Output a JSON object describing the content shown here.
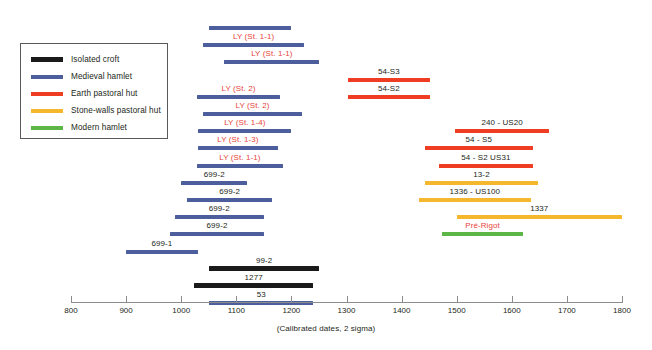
{
  "chart_data": {
    "type": "bar",
    "orientation": "horizontal-ranges",
    "title": "",
    "xlabel": "(Calibrated dates, 2 sigma)",
    "ylabel": "",
    "xlim": [
      800,
      1800
    ],
    "xticks": [
      800,
      900,
      1000,
      1100,
      1200,
      1300,
      1400,
      1500,
      1600,
      1700,
      1800
    ],
    "grid": false,
    "legend_position": "top-left",
    "categories": [
      "",
      "LY (St. 1-1)",
      "LY (St. 1-1)",
      "54-S3",
      "LY (St. 2)",
      "54-S2",
      "LY (St. 2)",
      "LY (St. 1-4)",
      "240 - US20",
      "LY (St. 1-3)",
      "54 - S5",
      "LY (St. 1-1)",
      "54 - S2 US31",
      "699-2",
      "13-2",
      "699-2",
      "1336 - US100",
      "699-2",
      "1337",
      "699-2",
      "Pré-Rigot",
      "699-1",
      "99-2",
      "1277",
      "53"
    ],
    "series": [
      {
        "name": "Isolated croft",
        "color": "#1a1a1a",
        "ranges": [
          {
            "label": "99-2",
            "start": 1051,
            "end": 1250
          },
          {
            "label": "1277",
            "start": 1023,
            "end": 1240
          }
        ]
      },
      {
        "name": "Medieval hamlet",
        "color": "#4d5e9c",
        "ranges": [
          {
            "label": "",
            "start": 1051,
            "end": 1200
          },
          {
            "label": "LY (St. 1-1)",
            "start": 1040,
            "end": 1223
          },
          {
            "label": "LY (St. 1-1)",
            "start": 1078,
            "end": 1251
          },
          {
            "label": "LY (St. 2)",
            "start": 1028,
            "end": 1180
          },
          {
            "label": "LY (St. 2)",
            "start": 1040,
            "end": 1219
          },
          {
            "label": "LY (St. 1-4)",
            "start": 1031,
            "end": 1200
          },
          {
            "label": "LY (St. 1-3)",
            "start": 1031,
            "end": 1175
          },
          {
            "label": "LY (St. 1-1)",
            "start": 1028,
            "end": 1185
          },
          {
            "label": "699-2",
            "start": 1000,
            "end": 1120
          },
          {
            "label": "699-2",
            "start": 1011,
            "end": 1165
          },
          {
            "label": "699-2",
            "start": 988,
            "end": 1150
          },
          {
            "label": "699-2",
            "start": 980,
            "end": 1150
          },
          {
            "label": "699-1",
            "start": 900,
            "end": 1030
          },
          {
            "label": "53",
            "start": 1051,
            "end": 1240
          }
        ]
      },
      {
        "name": "Earth pastoral hut",
        "color": "#ee3d23",
        "ranges": [
          {
            "label": "54-S3",
            "start": 1302,
            "end": 1452
          },
          {
            "label": "54-S2",
            "start": 1302,
            "end": 1452
          },
          {
            "label": "240 - US20",
            "start": 1497,
            "end": 1668
          },
          {
            "label": "54 - S5",
            "start": 1442,
            "end": 1638
          },
          {
            "label": "54 - S2 US31",
            "start": 1468,
            "end": 1638
          }
        ]
      },
      {
        "name": "Stone-walls pastoral hut",
        "color": "#f5b72e",
        "ranges": [
          {
            "label": "13-2",
            "start": 1442,
            "end": 1648
          },
          {
            "label": "1336 - US100",
            "start": 1431,
            "end": 1635
          },
          {
            "label": "1337",
            "start": 1500,
            "end": 1800
          }
        ]
      },
      {
        "name": "Modern hamlet",
        "color": "#5cb646",
        "ranges": [
          {
            "label": "Pré-Rigot",
            "start": 1474,
            "end": 1620
          }
        ]
      }
    ]
  },
  "legend": {
    "items": [
      {
        "label": "Isolated croft",
        "color": "#1a1a1a"
      },
      {
        "label": "Medieval hamlet",
        "color": "#4d5e9c"
      },
      {
        "label": "Earth pastoral hut",
        "color": "#ee3d23"
      },
      {
        "label": "Stone-walls pastoral hut",
        "color": "#f5b72e"
      },
      {
        "label": "Modern hamlet",
        "color": "#5cb646"
      }
    ]
  },
  "axis": {
    "title": "(Calibrated dates, 2 sigma)",
    "ticks": [
      "800",
      "900",
      "1000",
      "1100",
      "1200",
      "1300",
      "1400",
      "1500",
      "1600",
      "1700",
      "1800"
    ]
  },
  "bars": [
    {
      "label": "",
      "start": 1051,
      "end": 1200,
      "color": "#4d5e9c",
      "labelColor": "#231f20",
      "row": 0,
      "showLabel": false
    },
    {
      "label": "LY (St. 1-1)",
      "start": 1040,
      "end": 1223,
      "color": "#4d5e9c",
      "labelColor": "#e8443a",
      "row": 1,
      "showLabel": true
    },
    {
      "label": "LY (St. 1-1)",
      "start": 1078,
      "end": 1251,
      "color": "#4d5e9c",
      "labelColor": "#e8443a",
      "row": 2,
      "showLabel": true
    },
    {
      "label": "54-S3",
      "start": 1302,
      "end": 1452,
      "color": "#ee3d23",
      "labelColor": "#231f20",
      "row": 3,
      "showLabel": true
    },
    {
      "label": "LY (St. 2)",
      "start": 1028,
      "end": 1180,
      "color": "#4d5e9c",
      "labelColor": "#e8443a",
      "row": 4,
      "showLabel": true
    },
    {
      "label": "54-S2",
      "start": 1302,
      "end": 1452,
      "color": "#ee3d23",
      "labelColor": "#231f20",
      "row": 4,
      "showLabel": true
    },
    {
      "label": "LY (St. 2)",
      "start": 1040,
      "end": 1219,
      "color": "#4d5e9c",
      "labelColor": "#e8443a",
      "row": 5,
      "showLabel": true
    },
    {
      "label": "LY (St. 1-4)",
      "start": 1031,
      "end": 1200,
      "color": "#4d5e9c",
      "labelColor": "#e8443a",
      "row": 6,
      "showLabel": true
    },
    {
      "label": "240 - US20",
      "start": 1497,
      "end": 1668,
      "color": "#ee3d23",
      "labelColor": "#231f20",
      "row": 6,
      "showLabel": true
    },
    {
      "label": "LY (St. 1-3)",
      "start": 1031,
      "end": 1175,
      "color": "#4d5e9c",
      "labelColor": "#e8443a",
      "row": 7,
      "showLabel": true
    },
    {
      "label": "54 - S5",
      "start": 1442,
      "end": 1638,
      "color": "#ee3d23",
      "labelColor": "#231f20",
      "row": 7,
      "showLabel": true
    },
    {
      "label": "LY (St. 1-1)",
      "start": 1028,
      "end": 1185,
      "color": "#4d5e9c",
      "labelColor": "#e8443a",
      "row": 8,
      "showLabel": true
    },
    {
      "label": "54 - S2 US31",
      "start": 1468,
      "end": 1638,
      "color": "#ee3d23",
      "labelColor": "#231f20",
      "row": 8,
      "showLabel": true
    },
    {
      "label": "699-2",
      "start": 1000,
      "end": 1120,
      "color": "#4d5e9c",
      "labelColor": "#231f20",
      "row": 9,
      "showLabel": true
    },
    {
      "label": "13-2",
      "start": 1442,
      "end": 1648,
      "color": "#f5b72e",
      "labelColor": "#231f20",
      "row": 9,
      "showLabel": true
    },
    {
      "label": "699-2",
      "start": 1011,
      "end": 1165,
      "color": "#4d5e9c",
      "labelColor": "#231f20",
      "row": 10,
      "showLabel": true
    },
    {
      "label": "1336 - US100",
      "start": 1431,
      "end": 1635,
      "color": "#f5b72e",
      "labelColor": "#231f20",
      "row": 10,
      "showLabel": true
    },
    {
      "label": "699-2",
      "start": 988,
      "end": 1150,
      "color": "#4d5e9c",
      "labelColor": "#231f20",
      "row": 11,
      "showLabel": true
    },
    {
      "label": "1337",
      "start": 1500,
      "end": 1800,
      "color": "#f5b72e",
      "labelColor": "#231f20",
      "row": 11,
      "showLabel": true
    },
    {
      "label": "699-2",
      "start": 980,
      "end": 1150,
      "color": "#4d5e9c",
      "labelColor": "#231f20",
      "row": 12,
      "showLabel": true
    },
    {
      "label": "Pré-Rigot",
      "start": 1474,
      "end": 1620,
      "color": "#5cb646",
      "labelColor": "#e8443a",
      "row": 12,
      "showLabel": true
    },
    {
      "label": "699-1",
      "start": 900,
      "end": 1030,
      "color": "#4d5e9c",
      "labelColor": "#231f20",
      "row": 13,
      "showLabel": true
    },
    {
      "label": "99-2",
      "start": 1051,
      "end": 1250,
      "color": "#1a1a1a",
      "labelColor": "#231f20",
      "row": 14,
      "showLabel": true
    },
    {
      "label": "1277",
      "start": 1023,
      "end": 1240,
      "color": "#1a1a1a",
      "labelColor": "#231f20",
      "row": 15,
      "showLabel": true
    },
    {
      "label": "53",
      "start": 1051,
      "end": 1240,
      "color": "#4d5e9c",
      "labelColor": "#231f20",
      "row": 16,
      "showLabel": true
    }
  ]
}
